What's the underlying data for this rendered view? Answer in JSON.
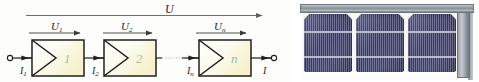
{
  "figure": {
    "kind": "series-connection-block-diagram-with-pv-module-photo"
  },
  "diagram": {
    "total_voltage_label": "U",
    "stage_voltage_labels": [
      "U",
      "U",
      "U"
    ],
    "stage_voltage_subscripts": [
      "1",
      "2",
      "n"
    ],
    "stage_block_labels": [
      "1",
      "2",
      "n"
    ],
    "current_labels": [
      "I",
      "I",
      "I",
      "I"
    ],
    "current_subscripts": [
      "1",
      "2",
      "n",
      ""
    ],
    "terminal_left": "terminal-node",
    "terminal_right": "terminal-node",
    "ellipsis_connection": "dotted-link",
    "colors": {
      "line": "#3a3a3a",
      "block_stroke": "#2b2b2b",
      "block_fill_start": "#ffffff",
      "block_fill_end": "#f7f3d2",
      "block_number": "#b9b9a6",
      "block_number_n": "#9fb8a8",
      "top_arrow": "#6b6b6b"
    }
  },
  "panel": {
    "description": "photovoltaic-module",
    "cell_count": 3,
    "busbars_per_cell": 2,
    "colors": {
      "cell_dark": "#35376a",
      "cell_light": "#4a4c82",
      "busbar": "#d2d4e4",
      "frame_light": "#c9cdd2",
      "frame_dark": "#70767f",
      "backsheet": "#f6f6f4"
    }
  }
}
